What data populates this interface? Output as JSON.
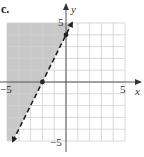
{
  "part_label": "c.",
  "chart_data": {
    "type": "line",
    "title": "",
    "xlabel": "x",
    "ylabel": "y",
    "xlim": [
      -5,
      5
    ],
    "ylim": [
      -5,
      5
    ],
    "grid": true,
    "tick_labels": {
      "x": [
        "-5",
        "5"
      ],
      "y": [
        "5",
        "-5"
      ]
    },
    "series": [
      {
        "name": "boundary y = 2x + 4",
        "style": "dashed",
        "x": [
          -4.5,
          0.5
        ],
        "y": [
          -5,
          5
        ],
        "marked_points": [
          [
            -2,
            0
          ],
          [
            0,
            4
          ]
        ]
      }
    ],
    "shaded_region": "left of / above the line (y > 2x + 4)",
    "colors": {
      "shade": "#c8c8c8",
      "grid": "#cfcfcf",
      "axis": "#555555",
      "line": "#222222"
    }
  }
}
